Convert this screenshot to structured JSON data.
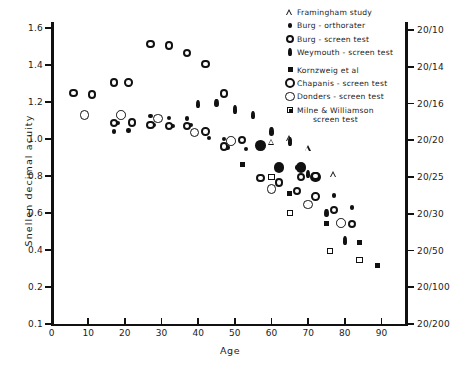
{
  "chart_data": {
    "type": "scatter",
    "title": "",
    "xlabel": "Age",
    "ylabel": "Snellen decimal acuity",
    "xlim": [
      0,
      97
    ],
    "ylim_labels": [
      "0.1",
      "0.2",
      "0.4",
      "0.6",
      "0.8",
      "1.0",
      "1.2",
      "1.4",
      "1.6"
    ],
    "x_ticks": [
      0,
      10,
      20,
      30,
      40,
      50,
      60,
      70,
      80,
      90
    ],
    "x_tick_labels": [
      "0",
      "10",
      "20",
      "30",
      "40",
      "50",
      "60",
      "70",
      "80",
      "90"
    ],
    "y_ticks_left": [
      0.1,
      0.2,
      0.4,
      0.6,
      0.8,
      1.0,
      1.2,
      1.4,
      1.6
    ],
    "y_tick_labels_left": [
      "0.1",
      "0.2",
      "0.4",
      "0.6",
      "0.8",
      "1.0",
      "1.2",
      "1.4",
      "1.6"
    ],
    "y_ticks_right_labels": [
      "20/10",
      "20/14",
      "20/16",
      "20/20",
      "20/25",
      "20/30",
      "20/50",
      "20/100",
      "20/200"
    ],
    "y_axis_right_title": "",
    "grid": false,
    "legend_position": "top-right",
    "series": [
      {
        "name": "Framingham study",
        "marker": "open-triangle",
        "color": "#111111",
        "points": [
          {
            "x": 60,
            "y": 0.985
          },
          {
            "x": 65,
            "y": 1.005
          },
          {
            "x": 70,
            "y": 0.95
          },
          {
            "x": 77,
            "y": 0.81
          }
        ]
      },
      {
        "name": "Burg - orthorater",
        "marker": "small-filled-circle",
        "color": "#111111",
        "points": [
          {
            "x": 17,
            "y": 1.04
          },
          {
            "x": 18,
            "y": 1.085
          },
          {
            "x": 21,
            "y": 1.045
          },
          {
            "x": 22,
            "y": 1.09
          },
          {
            "x": 27,
            "y": 1.125
          },
          {
            "x": 28,
            "y": 1.075
          },
          {
            "x": 32,
            "y": 1.115
          },
          {
            "x": 33,
            "y": 1.07
          },
          {
            "x": 37,
            "y": 1.11
          },
          {
            "x": 38,
            "y": 1.075
          },
          {
            "x": 42,
            "y": 1.04
          },
          {
            "x": 43,
            "y": 1.005
          },
          {
            "x": 47,
            "y": 1.0
          },
          {
            "x": 48,
            "y": 0.955
          },
          {
            "x": 52,
            "y": 0.995
          },
          {
            "x": 53,
            "y": 0.945
          },
          {
            "x": 57,
            "y": 0.955
          },
          {
            "x": 62,
            "y": 0.845
          },
          {
            "x": 67,
            "y": 0.845
          },
          {
            "x": 77,
            "y": 0.695
          },
          {
            "x": 82,
            "y": 0.63
          }
        ]
      },
      {
        "name": "Burg - screen test",
        "marker": "open-circle-thick",
        "color": "#111111",
        "points": [
          {
            "x": 17,
            "y": 1.085
          },
          {
            "x": 22,
            "y": 1.09
          },
          {
            "x": 27,
            "y": 1.075
          },
          {
            "x": 32,
            "y": 1.07
          },
          {
            "x": 37,
            "y": 1.07
          },
          {
            "x": 42,
            "y": 1.04
          },
          {
            "x": 47,
            "y": 0.96
          },
          {
            "x": 52,
            "y": 0.995
          },
          {
            "x": 57,
            "y": 0.79
          },
          {
            "x": 62,
            "y": 0.765
          },
          {
            "x": 67,
            "y": 0.72
          },
          {
            "x": 72,
            "y": 0.69
          },
          {
            "x": 77,
            "y": 0.615
          },
          {
            "x": 82,
            "y": 0.54
          }
        ]
      },
      {
        "name": "Weymouth - screen test",
        "marker": "filled-teardrop",
        "color": "#111111",
        "points": [
          {
            "x": 40,
            "y": 1.19
          },
          {
            "x": 45,
            "y": 1.195
          },
          {
            "x": 50,
            "y": 1.16
          },
          {
            "x": 55,
            "y": 1.13
          },
          {
            "x": 60,
            "y": 1.04
          },
          {
            "x": 65,
            "y": 0.985
          },
          {
            "x": 70,
            "y": 0.81
          },
          {
            "x": 75,
            "y": 0.6
          },
          {
            "x": 80,
            "y": 0.45
          }
        ]
      },
      {
        "name": "Kornzweig et al",
        "marker": "small-filled-square",
        "color": "#111111",
        "points": [
          {
            "x": 52,
            "y": 0.86
          },
          {
            "x": 65,
            "y": 0.705
          },
          {
            "x": 75,
            "y": 0.545
          },
          {
            "x": 84,
            "y": 0.44
          },
          {
            "x": 89,
            "y": 0.315
          }
        ]
      },
      {
        "name": "Chapanis - screen test",
        "marker": "large-filled-circle",
        "color": "#111111",
        "points": [
          {
            "x": 57,
            "y": 0.965
          },
          {
            "x": 62,
            "y": 0.845
          },
          {
            "x": 68,
            "y": 0.845
          },
          {
            "x": 72,
            "y": 0.795
          }
        ]
      },
      {
        "name": "Donders - screen test",
        "marker": "open-circle-thin",
        "color": "#111111",
        "points": [
          {
            "x": 9,
            "y": 1.13
          },
          {
            "x": 19,
            "y": 1.13
          },
          {
            "x": 29,
            "y": 1.11
          },
          {
            "x": 39,
            "y": 1.035
          },
          {
            "x": 49,
            "y": 0.99
          },
          {
            "x": 60,
            "y": 0.73
          },
          {
            "x": 70,
            "y": 0.645
          },
          {
            "x": 79,
            "y": 0.545
          }
        ]
      },
      {
        "name": "Milne & Williamson\nscreen test",
        "marker": "open-square",
        "color": "#111111",
        "points": [
          {
            "x": 60,
            "y": 0.795
          },
          {
            "x": 65,
            "y": 0.6
          },
          {
            "x": 76,
            "y": 0.395
          },
          {
            "x": 84,
            "y": 0.345
          }
        ]
      }
    ],
    "extra_open_circles_thick": [
      {
        "x": 6,
        "y": 1.25
      },
      {
        "x": 11,
        "y": 1.24
      },
      {
        "x": 17,
        "y": 1.305
      },
      {
        "x": 21,
        "y": 1.305
      },
      {
        "x": 27,
        "y": 1.515
      },
      {
        "x": 32,
        "y": 1.505
      },
      {
        "x": 37,
        "y": 1.465
      },
      {
        "x": 42,
        "y": 1.405
      },
      {
        "x": 47,
        "y": 1.245
      },
      {
        "x": 68,
        "y": 0.795
      },
      {
        "x": 72,
        "y": 0.8
      }
    ]
  },
  "axis": {
    "y_left_title": "Snellen decimal acuity",
    "x_title": "Age"
  },
  "legend": {
    "items": [
      {
        "label": "Framingham study",
        "marker": "open-triangle"
      },
      {
        "label": "Burg - orthorater",
        "marker": "small-filled-circle"
      },
      {
        "label": "Burg - screen test",
        "marker": "open-circle-thick"
      },
      {
        "label": "Weymouth - screen test",
        "marker": "filled-teardrop"
      },
      {
        "label": "Kornzweig et al",
        "marker": "small-filled-square"
      },
      {
        "label": "Chapanis - screen test",
        "marker": "large-open-circle"
      },
      {
        "label": "Donders - screen test",
        "marker": "open-circle-thin"
      },
      {
        "label": "Milne & Williamson\nscreen test",
        "marker": "open-square-pip"
      }
    ]
  }
}
